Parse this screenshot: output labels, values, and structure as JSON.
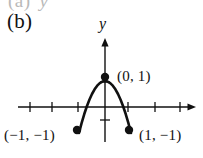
{
  "figure": {
    "panel_label": "(b)",
    "ghost_previous_panel": "(a)",
    "ghost_previous_panel_axis": "y",
    "background_color": "#ffffff",
    "ink_color": "#111111",
    "ghost_color": "#b9b9b9"
  },
  "axes": {
    "y_axis_label": "y",
    "x_axis_label": "",
    "origin_px": {
      "x": 105,
      "y": 107
    },
    "unit_px": 26,
    "x_axis": {
      "start_px": 18,
      "end_px": 196,
      "y_px": 107,
      "arrow": "right",
      "tick_positions_px": [
        30,
        52,
        78,
        128,
        155,
        180
      ],
      "tick_half_length_px": 5
    },
    "y_axis": {
      "top_px": 38,
      "bottom_px": 142,
      "x_px": 105,
      "arrow": "up",
      "tick_positions_px": [
        82,
        120
      ],
      "tick_half_length_px": 5
    }
  },
  "chart_data": {
    "type": "line",
    "title": "(b)",
    "xlabel": "",
    "ylabel": "y",
    "xlim": [
      -3.35,
      3.5
    ],
    "ylim": [
      -1.9,
      2.65
    ],
    "grid": false,
    "legend": false,
    "series": [
      {
        "name": "y = 1 - 2x^2",
        "equation": "y = 1 - 2x^2",
        "domain": [
          -1,
          1
        ],
        "x": [
          -1,
          -0.9,
          -0.8,
          -0.7,
          -0.6,
          -0.5,
          -0.4,
          -0.3,
          -0.2,
          -0.1,
          0,
          0.1,
          0.2,
          0.3,
          0.4,
          0.5,
          0.6,
          0.7,
          0.8,
          0.9,
          1
        ],
        "y": [
          -1,
          -0.62,
          -0.28,
          0.02,
          0.28,
          0.5,
          0.68,
          0.82,
          0.92,
          0.98,
          1,
          0.98,
          0.92,
          0.82,
          0.68,
          0.5,
          0.28,
          0.02,
          -0.28,
          -0.62,
          -1
        ],
        "style": "solid",
        "color": "#111111",
        "width_px": 2.6
      }
    ],
    "points": [
      {
        "name": "vertex",
        "x": 0,
        "y": 1,
        "label": "(0, 1)",
        "marker": "filled-circle",
        "px": {
          "x": 105,
          "y": 77
        }
      },
      {
        "name": "left-endpoint",
        "x": -1,
        "y": -1,
        "label": "(-1, -1)",
        "marker": "filled-circle",
        "px": {
          "x": 77,
          "y": 130
        }
      },
      {
        "name": "right-endpoint",
        "x": 1,
        "y": -1,
        "label": "(1, -1)",
        "marker": "filled-circle",
        "px": {
          "x": 129,
          "y": 130
        }
      }
    ],
    "annotations": [
      {
        "name": "vertex-label",
        "text": "(0, 1)"
      },
      {
        "name": "left-endpoint-label",
        "text": "(−1, −1)"
      },
      {
        "name": "right-endpoint-label",
        "text": "(1, −1)"
      }
    ]
  },
  "labels": {
    "vertex": "(0, 1)",
    "left_endpoint": "(−1, −1)",
    "right_endpoint": "(1, −1)"
  }
}
